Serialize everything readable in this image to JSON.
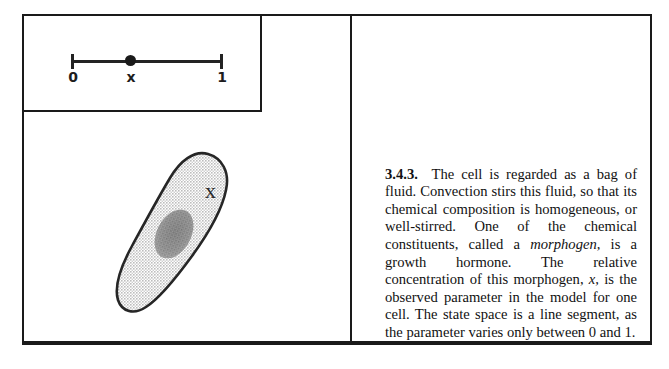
{
  "figure": {
    "state_space_diagram": {
      "name": "unit-interval-state-space",
      "axis_label_left": "0",
      "axis_label_point": "x",
      "axis_label_right": "1",
      "point_position_fraction": 0.38,
      "range": [
        0,
        1
      ]
    },
    "cell_diagram": {
      "name": "cell-blob",
      "label": "x",
      "fill_color": "#d9d9d9",
      "outline_color": "#262626",
      "nucleus_color": "#8d8d8d"
    }
  },
  "text": {
    "section_number": "3.4.3.",
    "paragraph": "The cell is regarded as a bag of fluid. Convection stirs this fluid, so that its chemical composition is homogeneous, or well-stirred. One of the chemical constituents, called a ",
    "italic_term": "morphogen,",
    "paragraph_cont": " is a growth hormone. The relative concentration of this morphogen, ",
    "italic_var": "x,",
    "paragraph_end": " is the observed parameter in the model for one cell. The state space is a line segment, as the parameter varies only between 0 and 1."
  },
  "colors": {
    "frame": "#1a1a1a",
    "ink": "#111111",
    "cell_fill": "#d9d9d9",
    "nucleus": "#8d8d8d"
  }
}
